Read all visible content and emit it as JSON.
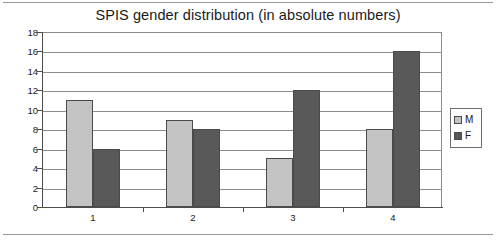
{
  "chart_data": {
    "type": "bar",
    "title": "SPIS gender distribution (in absolute numbers)",
    "xlabel": "",
    "ylabel": "",
    "categories": [
      "1",
      "2",
      "3",
      "4"
    ],
    "series": [
      {
        "name": "M",
        "values": [
          11,
          9,
          5,
          8
        ],
        "color": "#c3c3c3"
      },
      {
        "name": "F",
        "values": [
          6,
          8,
          12,
          16
        ],
        "color": "#595959"
      }
    ],
    "ylim": [
      0,
      18
    ],
    "yticks": [
      0,
      2,
      4,
      6,
      8,
      10,
      12,
      14,
      16,
      18
    ],
    "grid": true,
    "legend_position": "right"
  },
  "legend": {
    "entries": [
      {
        "label": "M",
        "color": "#c3c3c3"
      },
      {
        "label": "F",
        "color": "#595959"
      }
    ]
  },
  "colors": {
    "male": "#c3c3c3",
    "female": "#595959",
    "gridline": "#8d8d8d",
    "axis": "#4d4d4d",
    "frame": "#9a9a9a",
    "text": "#1a1a1a",
    "background": "#ffffff"
  }
}
